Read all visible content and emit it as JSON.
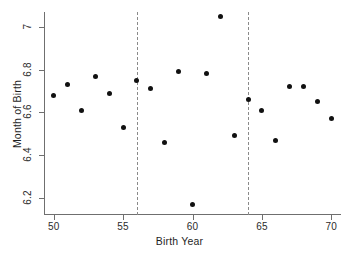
{
  "chart_data": {
    "type": "scatter",
    "title": "",
    "xlabel": "Birth Year",
    "ylabel": "Month of Birth",
    "xlim": [
      49.3,
      70.7
    ],
    "ylim": [
      6.12,
      7.07
    ],
    "xticks": [
      50,
      55,
      60,
      65,
      70
    ],
    "yticks": [
      6.2,
      6.4,
      6.6,
      6.8,
      7
    ],
    "xticklabels": [
      "50",
      "55",
      "60",
      "65",
      "70"
    ],
    "yticklabels": [
      "6.2",
      "6.4",
      "6.6",
      "6.8",
      "7"
    ],
    "grid": false,
    "legend": null,
    "marker": "filled-circle",
    "marker_color": "#111111",
    "x": [
      50,
      51,
      52,
      53,
      54,
      55,
      56,
      57,
      58,
      59,
      60,
      61,
      62,
      63,
      64,
      65,
      66,
      67,
      68,
      69,
      70
    ],
    "y": [
      6.68,
      6.73,
      6.61,
      6.77,
      6.69,
      6.53,
      6.75,
      6.71,
      6.46,
      6.79,
      6.17,
      6.78,
      7.05,
      6.49,
      6.66,
      6.61,
      6.47,
      6.72,
      6.72,
      6.65,
      6.57
    ],
    "annotations": [
      {
        "type": "vertical-dashed-line",
        "x": 56,
        "color": "#8a8a8a"
      },
      {
        "type": "vertical-dashed-line",
        "x": 64,
        "color": "#8a8a8a"
      }
    ]
  }
}
